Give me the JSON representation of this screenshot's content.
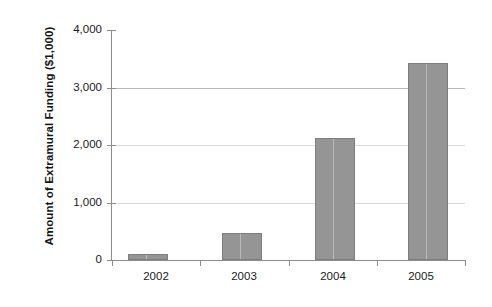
{
  "chart_data": {
    "type": "bar",
    "title": "",
    "xlabel": "",
    "ylabel": "Amount of Extramural Funding ($1,000)",
    "categories": [
      "2002",
      "2003",
      "2004",
      "2005"
    ],
    "values": [
      100,
      470,
      2120,
      3430
    ],
    "series": [
      {
        "name": "Extramural Funding",
        "values": [
          100,
          470,
          2120,
          3430
        ]
      }
    ],
    "ylim": [
      0,
      4000
    ],
    "yticks": [
      0,
      1000,
      2000,
      3000,
      4000
    ],
    "ytick_labels": [
      "0",
      "1,000",
      "2,000",
      "3,000",
      "4,000"
    ],
    "grid": true,
    "grid_axis": "y",
    "legend": false,
    "bar_color": "#959595",
    "bar_edge_color": "#7e7e7e",
    "axis_color": "#8d8d8d",
    "gridline_color": "#b9b9b9",
    "background_color": "#ffffff"
  },
  "axis": {
    "y_title": "Amount of Extramural Funding ($1,000)",
    "ticks": {
      "t4000": "4,000",
      "t3000": "3,000",
      "t2000": "2,000",
      "t1000": "1,000",
      "t0": "0"
    }
  },
  "categories": {
    "c0": "2002",
    "c1": "2003",
    "c2": "2004",
    "c3": "2005"
  }
}
